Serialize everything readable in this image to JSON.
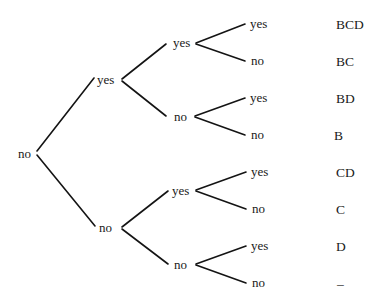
{
  "diagram": {
    "type": "decision-tree",
    "root": {
      "label": "no"
    },
    "level1": [
      {
        "label": "yes"
      },
      {
        "label": "no"
      }
    ],
    "level2": [
      {
        "label": "yes"
      },
      {
        "label": "no"
      },
      {
        "label": "yes"
      },
      {
        "label": "no"
      }
    ],
    "level3": [
      {
        "label": "yes"
      },
      {
        "label": "no"
      },
      {
        "label": "yes"
      },
      {
        "label": "no"
      },
      {
        "label": "yes"
      },
      {
        "label": "no"
      },
      {
        "label": "yes"
      },
      {
        "label": "no"
      }
    ],
    "outcomes": [
      {
        "label": "BCD"
      },
      {
        "label": "BC"
      },
      {
        "label": "BD"
      },
      {
        "label": "B"
      },
      {
        "label": "CD"
      },
      {
        "label": "C"
      },
      {
        "label": "D"
      },
      {
        "label": "–"
      }
    ]
  },
  "colors": {
    "background": "#ffffff",
    "line": "#141414",
    "text": "#1a1a1a"
  }
}
